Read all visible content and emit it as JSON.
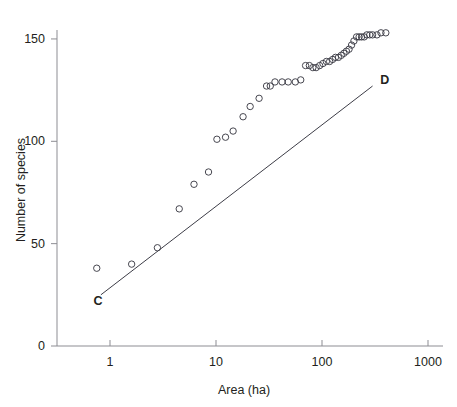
{
  "chart_data": {
    "type": "scatter",
    "title": "",
    "subtitle": "",
    "xlabel": "Area (ha)",
    "ylabel": "Number of species",
    "xscale": "log",
    "yscale": "linear",
    "xlim": [
      0.4,
      1200
    ],
    "ylim": [
      0,
      158
    ],
    "grid": false,
    "legend": null,
    "xticks": [
      {
        "value": 1,
        "label": "1"
      },
      {
        "value": 10,
        "label": "10"
      },
      {
        "value": 100,
        "label": "100"
      },
      {
        "value": 1000,
        "label": "1000"
      }
    ],
    "yticks": [
      {
        "value": 0,
        "label": "0"
      },
      {
        "value": 50,
        "label": "50"
      },
      {
        "value": 100,
        "label": "100"
      },
      {
        "value": 150,
        "label": "150"
      }
    ],
    "series": [
      {
        "name": "species-area data",
        "type": "scatter",
        "marker": "open-circle",
        "marker_color": "#3d3d47",
        "marker_size": 4.4,
        "x": [
          0.75,
          1.6,
          2.8,
          4.5,
          6.2,
          8.5,
          10.2,
          12.3,
          14.5,
          18.0,
          21.0,
          25.5,
          30.0,
          32.5,
          36.0,
          42.0,
          48.0,
          56.0,
          63.0,
          70.0,
          76.0,
          82.0,
          88.0,
          95.0,
          102.0,
          110.0,
          118.0,
          126.0,
          134.0,
          143.0,
          152.0,
          161.0,
          170.0,
          180.0,
          190.0,
          200.0,
          212.0,
          224.0,
          236.0,
          250.0,
          265.0,
          282.0,
          300.0,
          330.0,
          360.0,
          400.0
        ],
        "y": [
          38,
          40,
          48,
          67,
          79,
          85,
          101,
          102,
          105,
          112,
          117,
          121,
          127,
          127,
          129,
          129,
          129,
          129,
          130,
          137,
          137,
          136,
          136,
          137,
          138,
          139,
          139,
          140,
          141,
          141,
          142,
          143,
          144,
          145,
          147,
          149,
          151,
          151,
          151,
          151,
          152,
          152,
          152,
          152,
          153,
          153
        ]
      },
      {
        "name": "reference line C-D",
        "type": "line",
        "line_color": "#3d3d47",
        "line_width": 1,
        "x": [
          0.82,
          300
        ],
        "y": [
          25,
          127
        ],
        "start_label": "C",
        "end_label": "D"
      }
    ],
    "annotations": [
      {
        "text": "C",
        "x": 0.7,
        "y": 22,
        "name": "line-label-c"
      },
      {
        "text": "D",
        "x": 355,
        "y": 130,
        "name": "line-label-d"
      }
    ]
  }
}
